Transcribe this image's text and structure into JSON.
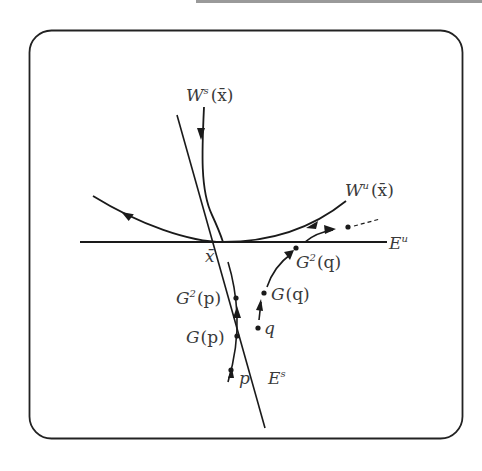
{
  "figure": {
    "frame": {
      "shape": "rounded-rectangle",
      "stroke": "#222222"
    },
    "top_rule_color": "#9a9a9a",
    "labels": {
      "stable_manifold": {
        "base": "W",
        "sup": "s",
        "arg": "(x̄)"
      },
      "unstable_manifold": {
        "base": "W",
        "sup": "u",
        "arg": "(x̄)"
      },
      "unstable_subspace": {
        "base": "E",
        "sup": "u"
      },
      "stable_subspace": {
        "base": "E",
        "sup": "s"
      },
      "fixed_point": "x̄",
      "p": "p",
      "Gp": {
        "base": "G",
        "arg": "(p)"
      },
      "G2p": {
        "base": "G",
        "sup": "2",
        "arg": "(p)"
      },
      "q": "q",
      "Gq": {
        "base": "G",
        "arg": "(q)"
      },
      "G2q": {
        "base": "G",
        "sup": "2",
        "arg": "(q)"
      }
    },
    "orbits": {
      "p_orbit_points": [
        "p",
        "G(p)",
        "G²(p)"
      ],
      "q_orbit_points": [
        "q",
        "G(q)",
        "G²(q)"
      ]
    },
    "stroke_color": "#1a1a1a"
  }
}
